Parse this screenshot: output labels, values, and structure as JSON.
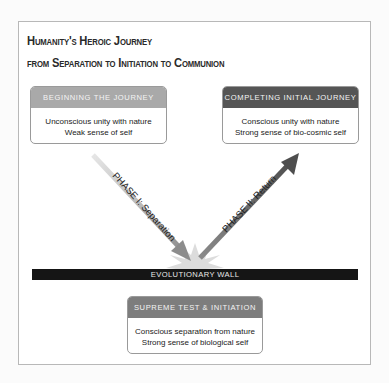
{
  "title": {
    "line1": "Humanity's Heroic Journey",
    "line2": "from Separation to Initiation to Communion"
  },
  "boxes": {
    "beginning": {
      "header": "BEGINNING THE JOURNEY",
      "lines": [
        "Unconscious unity with nature",
        "Weak sense of self"
      ],
      "header_color": "#a9a9a9"
    },
    "completing": {
      "header": "COMPLETING INITIAL JOURNEY",
      "lines": [
        "Conscious unity with nature",
        "Strong sense of bio-cosmic self"
      ],
      "header_color": "#555555"
    },
    "supreme": {
      "header": "SUPREME TEST & INITIATION",
      "lines": [
        "Conscious separation from nature",
        "Strong sense of biological self"
      ],
      "header_color": "#7d7d7d"
    }
  },
  "arrows": {
    "phase1": {
      "label": "PHASE I: Separation",
      "color": "#9a9a9a",
      "icon": "arrow-down-right-icon"
    },
    "phase2": {
      "label": "PHASE II: Return",
      "color": "#5a5a5a",
      "icon": "arrow-up-right-icon"
    }
  },
  "wall": {
    "label": "EVOLUTIONARY WALL",
    "color": "#151515"
  },
  "burst": {
    "icon": "starburst-icon",
    "color": "#d8d8d8"
  }
}
